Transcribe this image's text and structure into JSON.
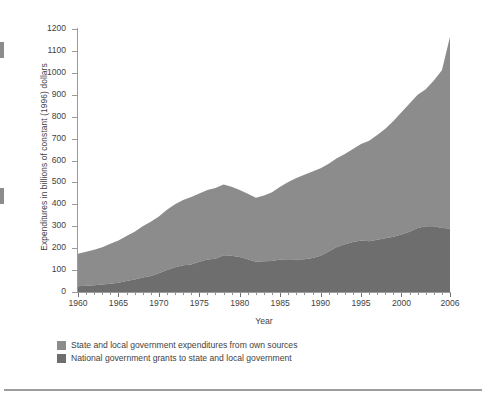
{
  "axes": {
    "ylabel": "Expenditures in billions of constant (1996) dollars",
    "xlabel": "Year",
    "y_ticks": [
      0,
      100,
      200,
      300,
      400,
      500,
      600,
      700,
      800,
      900,
      1000,
      1100,
      1200
    ],
    "x_ticks": [
      1960,
      1965,
      1970,
      1975,
      1980,
      1985,
      1990,
      1995,
      2000,
      2006
    ]
  },
  "legend": {
    "items": [
      {
        "label": "State and local government expenditures from own sources",
        "color": "#8c8c8c"
      },
      {
        "label": "National government grants to state and local government",
        "color": "#6e6e6e"
      }
    ]
  },
  "colors": {
    "own_sources": "#8c8c8c",
    "grants": "#6e6e6e",
    "axis": "#9a9a9a",
    "text": "#3f3f3f",
    "rule": "#9d9d9d"
  },
  "chart_data": {
    "type": "area",
    "stacked": true,
    "title": "",
    "xlabel": "Year",
    "ylabel": "Expenditures in billions of constant (1996) dollars",
    "xlim": [
      1960,
      2006
    ],
    "ylim": [
      0,
      1200
    ],
    "grid": false,
    "legend_position": "bottom-left",
    "x": [
      1960,
      1961,
      1962,
      1963,
      1964,
      1965,
      1966,
      1967,
      1968,
      1969,
      1970,
      1971,
      1972,
      1973,
      1974,
      1975,
      1976,
      1977,
      1978,
      1979,
      1980,
      1981,
      1982,
      1983,
      1984,
      1985,
      1986,
      1987,
      1988,
      1989,
      1990,
      1991,
      1992,
      1993,
      1994,
      1995,
      1996,
      1997,
      1998,
      1999,
      2000,
      2001,
      2002,
      2003,
      2004,
      2005,
      2006
    ],
    "series": [
      {
        "name": "National government grants to state and local government",
        "color": "#6e6e6e",
        "values": [
          26,
          29,
          31,
          34,
          38,
          42,
          50,
          57,
          66,
          73,
          85,
          100,
          113,
          122,
          126,
          138,
          148,
          152,
          168,
          165,
          160,
          150,
          138,
          140,
          142,
          148,
          150,
          148,
          150,
          155,
          165,
          185,
          205,
          218,
          228,
          235,
          232,
          238,
          245,
          252,
          262,
          275,
          292,
          300,
          300,
          292,
          290
        ]
      },
      {
        "name": "State and local government expenditures from own sources",
        "color": "#8c8c8c",
        "values": [
          149,
          155,
          162,
          170,
          182,
          193,
          205,
          218,
          234,
          247,
          260,
          275,
          287,
          298,
          307,
          312,
          317,
          323,
          322,
          315,
          305,
          298,
          292,
          300,
          313,
          332,
          352,
          372,
          385,
          395,
          400,
          400,
          405,
          412,
          425,
          440,
          458,
          478,
          500,
          528,
          558,
          585,
          608,
          625,
          665,
          720,
          875
        ]
      }
    ],
    "totals": [
      175,
      184,
      193,
      204,
      220,
      235,
      255,
      275,
      300,
      320,
      345,
      375,
      400,
      420,
      433,
      450,
      465,
      475,
      490,
      480,
      465,
      448,
      430,
      440,
      455,
      480,
      502,
      520,
      535,
      550,
      565,
      585,
      610,
      630,
      653,
      675,
      690,
      716,
      745,
      780,
      820,
      860,
      900,
      925,
      965,
      1012,
      1165
    ]
  }
}
